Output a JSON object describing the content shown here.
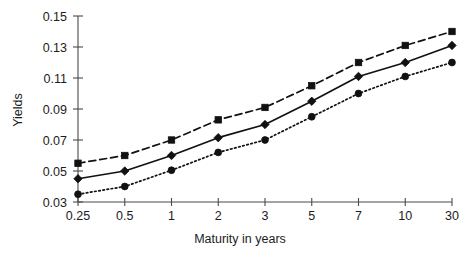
{
  "chart_data": {
    "type": "line",
    "title": "",
    "xlabel": "Maturity in years",
    "ylabel": "Yields",
    "categories": [
      "0.25",
      "0.5",
      "1",
      "2",
      "3",
      "5",
      "7",
      "10",
      "30"
    ],
    "x_tick_labels": [
      "0.25",
      "0.5",
      "1",
      "2",
      "3",
      "5",
      "7",
      "10",
      "30"
    ],
    "y_tick_labels": [
      "0.03",
      "0.05",
      "0.07",
      "0.09",
      "0.11",
      "0.13",
      "0.15"
    ],
    "y_tick_values": [
      0.03,
      0.05,
      0.07,
      0.09,
      0.11,
      0.13,
      0.15
    ],
    "ylim": [
      0.03,
      0.15
    ],
    "grid": false,
    "legend": "none",
    "series": [
      {
        "name": "upper-series",
        "marker": "square",
        "line_style": "dashed",
        "color": "#111111",
        "values": [
          0.055,
          0.06,
          0.07,
          0.083,
          0.091,
          0.105,
          0.12,
          0.131,
          0.14
        ]
      },
      {
        "name": "middle-series",
        "marker": "diamond",
        "line_style": "solid",
        "color": "#111111",
        "values": [
          0.045,
          0.05,
          0.06,
          0.0715,
          0.08,
          0.095,
          0.111,
          0.12,
          0.131
        ]
      },
      {
        "name": "lower-series",
        "marker": "circle",
        "line_style": "dotted",
        "color": "#111111",
        "values": [
          0.035,
          0.04,
          0.0505,
          0.062,
          0.07,
          0.085,
          0.1,
          0.111,
          0.12
        ]
      }
    ]
  },
  "axes": {
    "y_title": "Yields",
    "x_title": "Maturity in years"
  },
  "colors": {
    "ink": "#111111",
    "axis": "#4a4a4a",
    "background": "#ffffff"
  }
}
